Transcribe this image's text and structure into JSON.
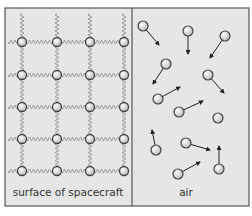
{
  "diagram": {
    "frame": {
      "x": 5,
      "y": 8,
      "width": 244,
      "height": 198,
      "divider_x": 132
    },
    "colors": {
      "background": "#e6e6e6",
      "frame": "#555555",
      "spring": "#9a9a9a",
      "particle_fill": "#dcdcdc",
      "particle_stroke": "#444444",
      "arrow": "#222222",
      "text": "#333333"
    },
    "left_panel": {
      "label": "surface of spacecraft",
      "lattice": {
        "columns_x": [
          22,
          57,
          90,
          124
        ],
        "rows_y": [
          42,
          75,
          107,
          139,
          171
        ],
        "particle_radius": 4.5
      }
    },
    "right_panel": {
      "label": "air",
      "particles": [
        {
          "x": 143,
          "y": 26,
          "arrow_to": [
            159,
            45
          ]
        },
        {
          "x": 188,
          "y": 31,
          "arrow_to": [
            188,
            54
          ]
        },
        {
          "x": 225,
          "y": 36,
          "arrow_to": [
            210,
            58
          ]
        },
        {
          "x": 166,
          "y": 64,
          "arrow_to": [
            153,
            84
          ]
        },
        {
          "x": 208,
          "y": 75,
          "arrow_to": [
            224,
            93
          ]
        },
        {
          "x": 158,
          "y": 99,
          "arrow_to": [
            180,
            87
          ]
        },
        {
          "x": 179,
          "y": 112,
          "arrow_to": [
            203,
            101
          ]
        },
        {
          "x": 218,
          "y": 118,
          "arrow_to": null
        },
        {
          "x": 156,
          "y": 150,
          "arrow_to": [
            152,
            130
          ]
        },
        {
          "x": 186,
          "y": 143,
          "arrow_to": [
            210,
            150
          ]
        },
        {
          "x": 219,
          "y": 169,
          "arrow_to": [
            219,
            146
          ]
        },
        {
          "x": 178,
          "y": 174,
          "arrow_to": [
            200,
            162
          ]
        }
      ],
      "particle_radius": 5
    }
  }
}
